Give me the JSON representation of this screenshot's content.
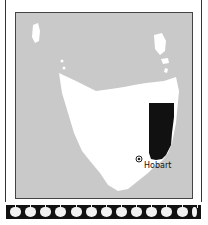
{
  "map": {
    "region": "Tasmania",
    "sea_color": "#c9c9c9",
    "land_color": "#ffffff",
    "highlight_color": "#111111",
    "city": {
      "name": "Hobart",
      "marker": "city-dot-icon"
    }
  },
  "footer": {
    "icons": [
      "apple-icon",
      "apple-icon",
      "apple-icon",
      "apple-icon",
      "apple-icon",
      "apple-icon",
      "apple-icon",
      "apple-icon",
      "apple-icon",
      "apple-icon",
      "apple-icon",
      "apple-icon",
      "apple-icon"
    ]
  }
}
